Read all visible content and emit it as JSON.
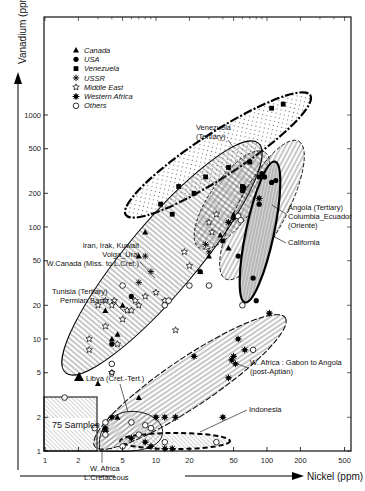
{
  "chart_data": {
    "type": "scatter",
    "title": "",
    "xlabel": "Nickel (ppm)",
    "ylabel": "Vanadium (ppm)",
    "xscale": "log",
    "yscale": "log",
    "xlim": [
      1,
      600
    ],
    "ylim": [
      1,
      2000
    ],
    "grid": false,
    "legend_position": "upper-left",
    "x_ticks": [
      1,
      2,
      5,
      10,
      20,
      50,
      100,
      200,
      500
    ],
    "y_ticks": [
      1,
      2,
      5,
      10,
      20,
      50,
      100,
      200,
      500,
      1000
    ],
    "legend": [
      {
        "name": "Canada",
        "marker": "filled-triangle"
      },
      {
        "name": "USA",
        "marker": "filled-circle"
      },
      {
        "name": "Venezuela",
        "marker": "filled-square"
      },
      {
        "name": "USSR",
        "marker": "asterisk"
      },
      {
        "name": "Middle East",
        "marker": "open-star"
      },
      {
        "name": "Western Africa",
        "marker": "filled-star"
      },
      {
        "name": "Others",
        "marker": "open-circle"
      }
    ],
    "series": [
      {
        "name": "Venezuela",
        "points": [
          [
            110,
            1150
          ],
          [
            140,
            1250
          ],
          [
            45,
            340
          ],
          [
            22,
            200
          ],
          [
            14,
            130
          ],
          [
            11,
            160
          ],
          [
            16,
            230
          ],
          [
            28,
            280
          ],
          [
            60,
            230
          ],
          [
            70,
            380
          ],
          [
            85,
            280
          ]
        ]
      },
      {
        "name": "Canada",
        "points": [
          [
            8,
            90
          ],
          [
            7,
            55
          ],
          [
            4,
            10
          ],
          [
            4.5,
            11
          ],
          [
            3.5,
            18
          ],
          [
            4.5,
            2
          ],
          [
            3,
            4
          ],
          [
            7,
            3
          ],
          [
            45,
            65
          ],
          [
            38,
            85
          ],
          [
            30,
            55
          ],
          [
            50,
            130
          ],
          [
            5,
            20
          ],
          [
            25,
            40
          ]
        ]
      },
      {
        "name": "USA",
        "points": [
          [
            95,
            280
          ],
          [
            110,
            250
          ],
          [
            120,
            260
          ],
          [
            60,
            210
          ],
          [
            62,
            225
          ],
          [
            55,
            55
          ],
          [
            75,
            35
          ],
          [
            80,
            22
          ],
          [
            85,
            160
          ],
          [
            4,
            9
          ],
          [
            4,
            6
          ],
          [
            4,
            5
          ],
          [
            6,
            24
          ],
          [
            25,
            40
          ],
          [
            40,
            75
          ],
          [
            90,
            300
          ]
        ]
      },
      {
        "name": "USSR",
        "points": [
          [
            8,
            55
          ],
          [
            7,
            32
          ],
          [
            9,
            40
          ],
          [
            30,
            60
          ],
          [
            28,
            70
          ]
        ]
      },
      {
        "name": "Middle East",
        "points": [
          [
            3,
            20
          ],
          [
            3.5,
            22
          ],
          [
            4,
            20
          ],
          [
            4.2,
            22
          ],
          [
            5.5,
            18
          ],
          [
            6,
            18
          ],
          [
            7,
            20
          ],
          [
            6.5,
            22
          ],
          [
            8,
            24
          ],
          [
            5,
            15
          ],
          [
            3.5,
            13
          ],
          [
            4.5,
            9
          ],
          [
            2.5,
            10
          ],
          [
            2.5,
            8
          ],
          [
            4,
            5
          ],
          [
            10,
            26
          ],
          [
            12,
            22
          ],
          [
            15,
            12
          ],
          [
            30,
            110
          ],
          [
            32,
            90
          ],
          [
            35,
            130
          ],
          [
            20,
            45
          ],
          [
            18,
            60
          ]
        ]
      },
      {
        "name": "Western Africa",
        "points": [
          [
            105,
            17
          ],
          [
            55,
            10
          ],
          [
            63,
            8
          ],
          [
            50,
            7
          ],
          [
            48,
            6.5
          ],
          [
            52,
            6
          ],
          [
            22,
            7
          ],
          [
            45,
            4.5
          ],
          [
            15,
            2
          ],
          [
            12,
            2
          ],
          [
            10,
            2
          ],
          [
            40,
            2
          ],
          [
            4,
            2
          ],
          [
            3.5,
            1.5
          ],
          [
            6,
            1.3
          ],
          [
            8,
            1.2
          ],
          [
            9,
            1.1
          ],
          [
            12,
            1.05
          ],
          [
            14,
            1.05
          ],
          [
            3.5,
            1.6
          ],
          [
            50,
            120
          ],
          [
            45,
            110
          ],
          [
            85,
            180
          ]
        ]
      },
      {
        "name": "Others",
        "points": [
          [
            1.5,
            3
          ],
          [
            5,
            30
          ],
          [
            4,
            6
          ],
          [
            6,
            1.8
          ],
          [
            8,
            1.7
          ],
          [
            9,
            1.6
          ],
          [
            3.5,
            1.8
          ],
          [
            2.8,
            1.6
          ],
          [
            3.5,
            1.4
          ],
          [
            5,
            1.1
          ],
          [
            7,
            1.4
          ],
          [
            12,
            1.2
          ],
          [
            35,
            1.2
          ],
          [
            30,
            30
          ],
          [
            75,
            8
          ],
          [
            55,
            125
          ],
          [
            58,
            115
          ],
          [
            60,
            20
          ],
          [
            20,
            30
          ],
          [
            12,
            20
          ],
          [
            13,
            22
          ]
        ]
      }
    ],
    "annotations": [
      {
        "text": "Venezuela (Tertiary)",
        "x": 30,
        "y": 370
      },
      {
        "text": "Angola (Tertiary)",
        "x": 150,
        "y": 95
      },
      {
        "text": "Columbia_Ecuador",
        "x": 150,
        "y": 95
      },
      {
        "text": "(Oriente)",
        "x": 150,
        "y": 95
      },
      {
        "text": "California",
        "x": 150,
        "y": 40
      },
      {
        "text": "Iran, Irak, Kuwait",
        "x": 3,
        "y": 75
      },
      {
        "text": "Volga_Ural",
        "x": 3,
        "y": 60
      },
      {
        "text": "W.Canada (Miss. to L.Cret.)",
        "x": 3,
        "y": 50
      },
      {
        "text": "Tunisia (Tertiary)",
        "x": 2,
        "y": 25
      },
      {
        "text": "Permian Basin",
        "x": 2,
        "y": 20
      },
      {
        "text": "W. Africa : Gabon to Angola",
        "x": 60,
        "y": 5
      },
      {
        "text": "(post-Aptian)",
        "x": 60,
        "y": 4.5
      },
      {
        "text": "Libya (Cret.-Tert.)",
        "x": 3,
        "y": 3.5
      },
      {
        "text": "Indonesia",
        "x": 80,
        "y": 2.5
      },
      {
        "text": "75 Samples",
        "x": 1.7,
        "y": 1.8
      },
      {
        "text": "W. Africa",
        "x": 3.5,
        "y": 0.8
      },
      {
        "text": "L.Cretaceous",
        "x": 3.5,
        "y": 0.7
      }
    ],
    "regions": [
      {
        "name": "Venezuela (Tertiary)",
        "fill": "dotted",
        "border": "dash-dot"
      },
      {
        "name": "Middle East / Volga-Ural / W.Canada / Tunisia / Permian Basin",
        "fill": "vertical-hatch"
      },
      {
        "name": "Iran-Irak-Kuwait core",
        "fill": "cross-hatch",
        "border": "dashed"
      },
      {
        "name": "Angola / Columbia-Ecuador",
        "fill": "horizontal-hatch",
        "border": "thin"
      },
      {
        "name": "California",
        "fill": "horizontal-lines-grey",
        "border": "bold"
      },
      {
        "name": "W. Africa Gabon to Angola (post-Aptian)",
        "fill": "horizontal-hatch",
        "border": "dash"
      },
      {
        "name": "Indonesia",
        "fill": "diagonal-hatch",
        "border": "bold-dashed"
      },
      {
        "name": "W. Africa L.Cretaceous",
        "fill": "diagonal-hatch"
      },
      {
        "name": "75 Samples",
        "fill": "diagonal-hatch-box"
      }
    ]
  },
  "labels": {
    "legend": [
      "Canada",
      "USA",
      "Venezuela",
      "USSR",
      "Middle East",
      "Western Africa",
      "Others"
    ],
    "venezuela": [
      "Venezuela",
      "(Tertiary)"
    ],
    "angola": [
      "Angola (Tertiary)",
      "Columbia_Ecuador",
      "(Oriente)"
    ],
    "california": "California",
    "iran": [
      "Iran, Irak, Kuwait",
      "Volga_Ural",
      "W.Canada (Miss. to L.Cret.)"
    ],
    "tunisia": [
      "Tunisia (Tertiary)",
      "Permian Basin"
    ],
    "wafrica": [
      "W. Africa : Gabon to Angola",
      "(post-Aptian)"
    ],
    "libya": "Libya (Cret.-Tert.)",
    "indonesia": "Indonesia",
    "samples": "75 Samples",
    "wafrica_lc": [
      "W. Africa",
      "L.Cretaceous"
    ],
    "xlabel": "Nickel (ppm)",
    "ylabel": "Vanadium (ppm)"
  }
}
